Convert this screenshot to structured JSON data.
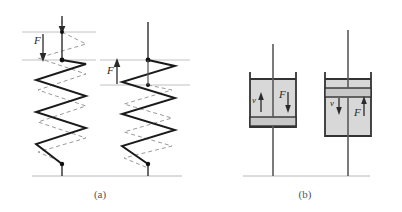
{
  "figure": {
    "background_color": "#ffffff",
    "ink_color": "#1a1a1a",
    "ghost_color": "#9a9a9a",
    "reference_line_color": "#c2c2c2",
    "cylinder_fill_color": "#d8d8d8",
    "piston_plate_color": "#c8c8c8"
  },
  "panels": [
    {
      "id": "panel-a",
      "caption": "(a)",
      "caption_x": 100,
      "caption_y": 198,
      "subject": "spring",
      "items": [
        {
          "id": "spring-left",
          "state": "stretched",
          "force_label": "F",
          "force_direction": "down",
          "label_x": 34,
          "label_y": 44
        },
        {
          "id": "spring-right",
          "state": "compressed",
          "force_label": "F",
          "force_direction": "up",
          "label_x": 107,
          "label_y": 74
        }
      ]
    },
    {
      "id": "panel-b",
      "caption": "(b)",
      "caption_x": 305,
      "caption_y": 198,
      "subject": "dashpot",
      "items": [
        {
          "id": "dashpot-left",
          "state": "piston-low",
          "velocity_label": "v",
          "velocity_direction": "up",
          "velocity_label_x": 252,
          "velocity_label_y": 100,
          "force_label": "F",
          "force_direction": "down",
          "force_label_x": 281,
          "force_label_y": 97
        },
        {
          "id": "dashpot-right",
          "state": "piston-high",
          "velocity_label": "v",
          "velocity_direction": "down",
          "velocity_label_x": 332,
          "velocity_label_y": 103,
          "force_label": "F",
          "force_direction": "up",
          "force_label_x": 357,
          "force_label_y": 114
        }
      ]
    }
  ]
}
